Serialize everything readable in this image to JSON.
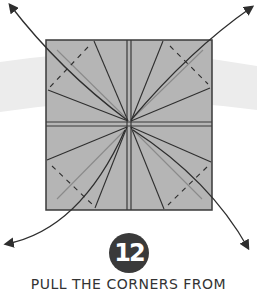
{
  "step": {
    "number": "12",
    "instruction": "PULL THE CORNERS FROM"
  },
  "colors": {
    "paper_fill": "#b5b5b5",
    "fold_line": "#2e2e2e",
    "crease_line": "#8a8a8a",
    "background_band": "#ececec",
    "badge": "#3a3a3a"
  },
  "diagram": {
    "arrows": [
      "top-left",
      "top-right",
      "bottom-left",
      "bottom-right"
    ],
    "line_types": [
      "solid fold lines",
      "grey crease lines",
      "dashed valley-fold lines"
    ]
  }
}
